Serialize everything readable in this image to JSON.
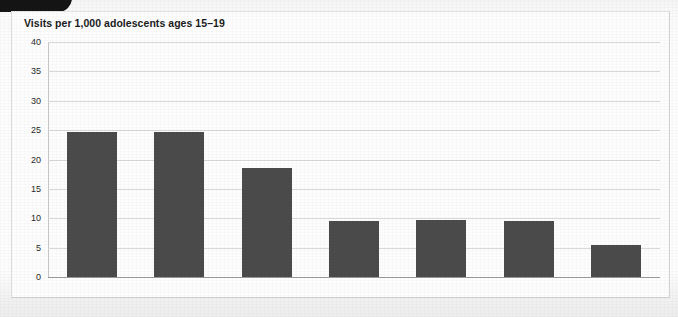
{
  "figure": {
    "title": "Visits per 1,000 adolescents ages 15–19",
    "corner_tab_name": "corner-tab"
  },
  "colors": {
    "bar": "#4b4b4b",
    "gridline": "#d8d8d8",
    "baseline": "#9a9a9a",
    "card_background": "#fdfdfd",
    "page_background": "#f2f2f2",
    "text": "#1c1c1c",
    "corner_tab": "#151515"
  },
  "chart_data": {
    "type": "bar",
    "title": "Visits per 1,000 adolescents ages 15–19",
    "xlabel": "",
    "ylabel": "Visits per 1,000 adolescents ages 15–19",
    "categories": [
      "Struck",
      "Fall",
      "Motor vehicle traffic",
      "Overexertion",
      "Poisoning",
      "Cut or pierced",
      "Natural or environmental"
    ],
    "category_lines": [
      [
        "Struck"
      ],
      [
        "Fall"
      ],
      [
        "Motor vehicle",
        "traffic"
      ],
      [
        "Overexertion"
      ],
      [
        "Poisoning"
      ],
      [
        "Cut or pierced"
      ],
      [
        "Natural or",
        "environmental"
      ]
    ],
    "values": [
      24.7,
      24.7,
      18.6,
      9.6,
      9.7,
      9.6,
      5.5
    ],
    "ylim": [
      0,
      40
    ],
    "yticks": [
      0,
      5,
      10,
      15,
      20,
      25,
      30,
      35,
      40
    ],
    "ytick_labels": [
      "0",
      "5",
      "10",
      "15",
      "20",
      "25",
      "30",
      "35",
      "40"
    ],
    "grid": true,
    "legend": null,
    "legend_position": "none",
    "bar_color": "#4b4b4b",
    "orientation": "vertical"
  }
}
